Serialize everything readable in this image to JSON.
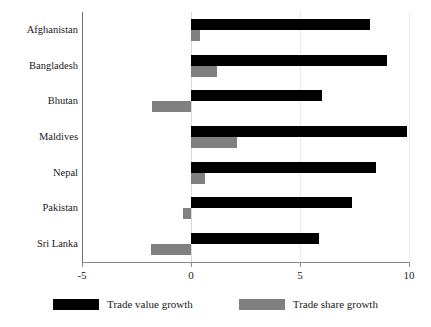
{
  "chart_data": {
    "type": "bar",
    "orientation": "horizontal",
    "title": "",
    "subtitle": "",
    "xlabel": "",
    "ylabel": "",
    "xlim": [
      -5,
      10
    ],
    "xticks": [
      "-5",
      "0",
      "5",
      "10"
    ],
    "xtick_values": [
      -5,
      0,
      5,
      10
    ],
    "grid": true,
    "legend_position": "bottom",
    "categories": [
      "Afghanistan",
      "Bangladesh",
      "Bhutan",
      "Maldives",
      "Nepal",
      "Pakistan",
      "Sri Lanka"
    ],
    "series": [
      {
        "name": "Trade value growth",
        "color": "#000000",
        "values": [
          8.2,
          9.0,
          6.0,
          9.9,
          8.5,
          7.4,
          5.85
        ]
      },
      {
        "name": "Trade share growth",
        "color": "#808080",
        "values": [
          0.4,
          1.2,
          -1.8,
          2.1,
          0.65,
          -0.35,
          -1.85
        ]
      }
    ]
  },
  "legend": {
    "items": [
      {
        "label": "Trade value growth",
        "color": "#000000"
      },
      {
        "label": "Trade share growth",
        "color": "#808080"
      }
    ]
  },
  "colors": {
    "value_series": "#000000",
    "share_series": "#808080",
    "axis": "#8a8a8a",
    "grid": "#e9e9e9",
    "background": "#ffffff"
  }
}
